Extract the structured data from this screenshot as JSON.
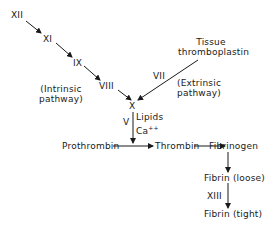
{
  "diagram": {
    "intrinsic": {
      "factors": [
        "XII",
        "XI",
        "IX",
        "VIII"
      ],
      "label_line1": "(Intrinsic",
      "label_line2": "pathway)"
    },
    "extrinsic": {
      "source_line1": "Tissue",
      "source_line2": "thromboplastin",
      "factor": "VII",
      "label_line1": "(Extrinsic",
      "label_line2": "pathway)"
    },
    "convergence": {
      "factor": "X",
      "cofactor": "V",
      "lipids": "Lipids",
      "calcium": "Ca",
      "calcium_charge": "++"
    },
    "common": {
      "prothrombin": "Prothrombin",
      "thrombin": "Thrombin",
      "fibrinogen": "Fibrinogen",
      "fibrin_loose": "Fibrin (loose)",
      "crosslinker": "XIII",
      "fibrin_tight": "Fibrin (tight)"
    },
    "line_color": "#1a1a1a"
  }
}
